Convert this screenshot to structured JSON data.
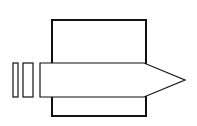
{
  "diagram": {
    "background": "#ffffff",
    "stroke_color": "#111111",
    "shapes": {
      "housing_rect": {
        "x": 52,
        "y": 20,
        "w": 94,
        "h": 96,
        "stroke_width": 2
      },
      "arrow": {
        "body_left": 40,
        "body_right": 144,
        "top": 63,
        "bottom": 97,
        "tip_x": 185,
        "tip_y": 80,
        "stroke_width": 1.2,
        "fill": "#ffffff"
      },
      "bars": [
        {
          "x": 13,
          "y": 63,
          "w": 5,
          "h": 34
        },
        {
          "x": 23,
          "y": 63,
          "w": 10,
          "h": 34
        }
      ]
    }
  }
}
